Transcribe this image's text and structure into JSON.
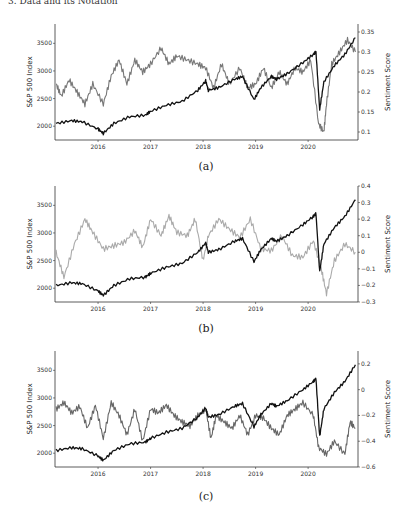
{
  "header_fragment": "3. Data and its Notation",
  "chart_data": [
    {
      "panel": "a",
      "type": "line",
      "caption": "(a)",
      "xlabel": "",
      "ylabel_left": "S&P 500 Index",
      "ylabel_right": "Sentiment Score",
      "x_ticks": [
        "2016",
        "2017",
        "2018",
        "2019",
        "2020"
      ],
      "y_left_ticks": [
        2000,
        2500,
        3000,
        3500
      ],
      "y_left_lim": [
        1750,
        3850
      ],
      "y_right_ticks": [
        0.1,
        0.15,
        0.2,
        0.25,
        0.3,
        0.35
      ],
      "y_right_lim": [
        0.08,
        0.37
      ],
      "x_range": [
        "2015-03",
        "2020-12"
      ],
      "series": [
        {
          "name": "S&P 500 Index",
          "axis": "left",
          "color": "#111111",
          "x": [
            2015.2,
            2015.5,
            2015.7,
            2016.0,
            2016.1,
            2016.3,
            2016.6,
            2016.9,
            2017.0,
            2017.3,
            2017.6,
            2017.9,
            2018.05,
            2018.1,
            2018.3,
            2018.6,
            2018.75,
            2018.97,
            2019.1,
            2019.3,
            2019.4,
            2019.6,
            2019.9,
            2020.1,
            2020.15,
            2020.22,
            2020.3,
            2020.5,
            2020.7,
            2020.9
          ],
          "values": [
            2050,
            2100,
            2080,
            1950,
            1870,
            2050,
            2170,
            2200,
            2270,
            2380,
            2450,
            2650,
            2820,
            2650,
            2700,
            2850,
            2900,
            2480,
            2700,
            2900,
            2850,
            2950,
            3150,
            3300,
            3350,
            2300,
            2800,
            3100,
            3300,
            3600
          ]
        },
        {
          "name": "Sentiment Score",
          "axis": "right",
          "color": "#777777",
          "x": [
            2015.2,
            2015.3,
            2015.45,
            2015.6,
            2015.75,
            2015.9,
            2016.1,
            2016.25,
            2016.4,
            2016.55,
            2016.7,
            2016.85,
            2017.0,
            2017.2,
            2017.35,
            2017.5,
            2017.7,
            2017.9,
            2018.05,
            2018.2,
            2018.35,
            2018.5,
            2018.7,
            2018.85,
            2019.0,
            2019.15,
            2019.3,
            2019.45,
            2019.6,
            2019.75,
            2019.9,
            2020.05,
            2020.2,
            2020.3,
            2020.35,
            2020.45,
            2020.6,
            2020.75,
            2020.9
          ],
          "values": [
            0.22,
            0.19,
            0.23,
            0.2,
            0.17,
            0.22,
            0.17,
            0.24,
            0.28,
            0.22,
            0.28,
            0.25,
            0.27,
            0.31,
            0.27,
            0.29,
            0.28,
            0.27,
            0.26,
            0.21,
            0.27,
            0.22,
            0.26,
            0.21,
            0.22,
            0.26,
            0.21,
            0.25,
            0.22,
            0.26,
            0.25,
            0.28,
            0.12,
            0.1,
            0.17,
            0.27,
            0.3,
            0.33,
            0.3
          ]
        }
      ]
    },
    {
      "panel": "b",
      "type": "line",
      "caption": "(b)",
      "ylabel_left": "S&P 500 Index",
      "ylabel_right": "Sentiment Score",
      "x_ticks": [
        "2016",
        "2017",
        "2018",
        "2019",
        "2020"
      ],
      "y_left_ticks": [
        2000,
        2500,
        3000,
        3500
      ],
      "y_left_lim": [
        1750,
        3850
      ],
      "y_right_ticks": [
        -0.3,
        -0.2,
        -0.1,
        0,
        0.1,
        0.2,
        0.3,
        0.4
      ],
      "y_right_lim": [
        -0.3,
        0.4
      ],
      "series": [
        {
          "name": "S&P 500 Index",
          "axis": "left",
          "color": "#111111",
          "x": [
            2015.2,
            2015.5,
            2015.7,
            2016.0,
            2016.1,
            2016.3,
            2016.6,
            2016.9,
            2017.0,
            2017.3,
            2017.6,
            2017.9,
            2018.05,
            2018.1,
            2018.3,
            2018.6,
            2018.75,
            2018.97,
            2019.1,
            2019.3,
            2019.4,
            2019.6,
            2019.9,
            2020.1,
            2020.15,
            2020.22,
            2020.3,
            2020.5,
            2020.7,
            2020.9
          ],
          "values": [
            2050,
            2100,
            2080,
            1950,
            1870,
            2050,
            2170,
            2200,
            2270,
            2380,
            2450,
            2650,
            2820,
            2650,
            2700,
            2850,
            2900,
            2480,
            2700,
            2900,
            2850,
            2950,
            3150,
            3300,
            3350,
            2300,
            2800,
            3100,
            3300,
            3600
          ]
        },
        {
          "name": "Sentiment Score",
          "axis": "right",
          "color": "#aaaaaa",
          "x": [
            2015.2,
            2015.35,
            2015.55,
            2015.75,
            2015.9,
            2016.1,
            2016.3,
            2016.5,
            2016.7,
            2016.85,
            2017.0,
            2017.2,
            2017.35,
            2017.5,
            2017.7,
            2017.85,
            2018.0,
            2018.1,
            2018.3,
            2018.5,
            2018.7,
            2018.9,
            2019.1,
            2019.3,
            2019.5,
            2019.7,
            2019.9,
            2020.1,
            2020.25,
            2020.35,
            2020.5,
            2020.7,
            2020.9
          ],
          "values": [
            0.0,
            -0.15,
            0.05,
            0.2,
            0.12,
            0.02,
            0.04,
            0.06,
            0.13,
            0.03,
            0.2,
            0.1,
            0.22,
            0.12,
            0.1,
            0.2,
            -0.05,
            0.1,
            0.2,
            0.14,
            0.09,
            0.2,
            0.02,
            0.01,
            0.1,
            -0.02,
            -0.03,
            0.07,
            -0.1,
            -0.25,
            -0.05,
            0.05,
            0.0
          ]
        }
      ]
    },
    {
      "panel": "c",
      "type": "line",
      "caption": "(c)",
      "ylabel_left": "S&P 500 Index",
      "ylabel_right": "Sentiment Score",
      "x_ticks": [
        "2016",
        "2017",
        "2018",
        "2019",
        "2020"
      ],
      "y_left_ticks": [
        2000,
        2500,
        3000,
        3500
      ],
      "y_left_lim": [
        1750,
        3850
      ],
      "y_right_ticks": [
        -0.6,
        -0.4,
        -0.2,
        0,
        0.2
      ],
      "y_right_lim": [
        -0.6,
        0.3
      ],
      "series": [
        {
          "name": "S&P 500 Index",
          "axis": "left",
          "color": "#111111",
          "x": [
            2015.2,
            2015.5,
            2015.7,
            2016.0,
            2016.1,
            2016.3,
            2016.6,
            2016.9,
            2017.0,
            2017.3,
            2017.6,
            2017.9,
            2018.05,
            2018.1,
            2018.3,
            2018.6,
            2018.75,
            2018.97,
            2019.1,
            2019.3,
            2019.4,
            2019.6,
            2019.9,
            2020.1,
            2020.15,
            2020.22,
            2020.3,
            2020.5,
            2020.7,
            2020.9
          ],
          "values": [
            2050,
            2100,
            2080,
            1950,
            1870,
            2050,
            2170,
            2200,
            2270,
            2380,
            2450,
            2650,
            2820,
            2650,
            2700,
            2850,
            2900,
            2480,
            2700,
            2900,
            2850,
            2950,
            3150,
            3300,
            3350,
            2300,
            2800,
            3100,
            3300,
            3600
          ]
        },
        {
          "name": "Sentiment Score",
          "axis": "right",
          "color": "#666666",
          "x": [
            2015.2,
            2015.35,
            2015.5,
            2015.65,
            2015.8,
            2015.95,
            2016.1,
            2016.25,
            2016.4,
            2016.55,
            2016.7,
            2016.85,
            2017.0,
            2017.15,
            2017.3,
            2017.45,
            2017.6,
            2017.75,
            2017.9,
            2018.05,
            2018.15,
            2018.25,
            2018.4,
            2018.55,
            2018.7,
            2018.85,
            2019.0,
            2019.15,
            2019.3,
            2019.45,
            2019.6,
            2019.75,
            2019.9,
            2020.1,
            2020.2,
            2020.35,
            2020.5,
            2020.7,
            2020.8,
            2020.9
          ],
          "values": [
            -0.15,
            -0.1,
            -0.18,
            -0.13,
            -0.3,
            -0.12,
            -0.38,
            -0.1,
            -0.2,
            -0.35,
            -0.15,
            -0.4,
            -0.15,
            -0.18,
            -0.12,
            -0.2,
            -0.25,
            -0.28,
            -0.2,
            -0.15,
            -0.38,
            -0.2,
            -0.25,
            -0.3,
            -0.2,
            -0.35,
            -0.2,
            -0.22,
            -0.3,
            -0.35,
            -0.2,
            -0.15,
            -0.1,
            -0.2,
            -0.45,
            -0.5,
            -0.4,
            -0.5,
            -0.25,
            -0.3
          ]
        }
      ]
    }
  ]
}
